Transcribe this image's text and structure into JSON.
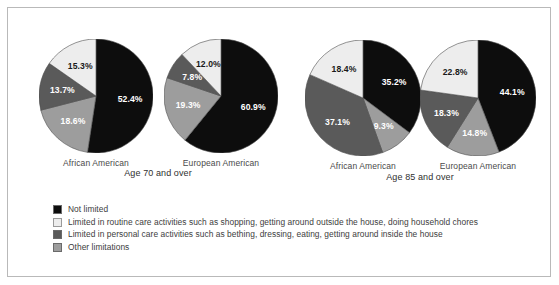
{
  "chart_data": {
    "type": "pie",
    "title": "",
    "subtitle": "",
    "legend_position": "bottom-left",
    "grid": false,
    "categories": [
      "Not limited",
      "Limited in routine care activities such as shopping, getting around outside the house, doing household chores",
      "Limited in personal care activities such as bething, dressing, eating, getting around inside the house",
      "Other limitations"
    ],
    "category_colors": [
      "#0d0d0d",
      "#ededed",
      "#5a5a5a",
      "#9d9d9d"
    ],
    "panels": [
      {
        "panel_label": "Age 70 and over",
        "pies": [
          {
            "name": "African American",
            "slices": [
              {
                "label": "Not limited",
                "value": 52.4,
                "display": "52.4%",
                "color": "#0d0d0d",
                "text_color": "#ffffff"
              },
              {
                "label": "Other limitations",
                "value": 18.6,
                "display": "18.6%",
                "color": "#9d9d9d",
                "text_color": "#ffffff"
              },
              {
                "label": "Limited in personal care activities such as bething, dressing, eating, getting around inside the house",
                "value": 13.7,
                "display": "13.7%",
                "color": "#5a5a5a",
                "text_color": "#ffffff"
              },
              {
                "label": "Limited in routine care activities such as shopping, getting around outside the house, doing household chores",
                "value": 15.3,
                "display": "15.3%",
                "color": "#ededed",
                "text_color": "#1a1a1a"
              }
            ]
          },
          {
            "name": "European American",
            "slices": [
              {
                "label": "Not limited",
                "value": 60.9,
                "display": "60.9%",
                "color": "#0d0d0d",
                "text_color": "#ffffff"
              },
              {
                "label": "Other limitations",
                "value": 19.3,
                "display": "19.3%",
                "color": "#9d9d9d",
                "text_color": "#ffffff"
              },
              {
                "label": "Limited in personal care activities such as bething, dressing, eating, getting around inside the house",
                "value": 7.8,
                "display": "7.8%",
                "color": "#5a5a5a",
                "text_color": "#ffffff"
              },
              {
                "label": "Limited in routine care activities such as shopping, getting around outside the house, doing household chores",
                "value": 12.0,
                "display": "12.0%",
                "color": "#ededed",
                "text_color": "#1a1a1a"
              }
            ]
          }
        ]
      },
      {
        "panel_label": "Age 85 and over",
        "pies": [
          {
            "name": "African American",
            "slices": [
              {
                "label": "Not limited",
                "value": 35.2,
                "display": "35.2%",
                "color": "#0d0d0d",
                "text_color": "#ffffff"
              },
              {
                "label": "Other limitations",
                "value": 9.3,
                "display": "9.3%",
                "color": "#9d9d9d",
                "text_color": "#ffffff"
              },
              {
                "label": "Limited in personal care activities such as bething, dressing, eating, getting around inside the house",
                "value": 37.1,
                "display": "37.1%",
                "color": "#5a5a5a",
                "text_color": "#ffffff"
              },
              {
                "label": "Limited in routine care activities such as shopping, getting around outside the house, doing household chores",
                "value": 18.4,
                "display": "18.4%",
                "color": "#ededed",
                "text_color": "#1a1a1a"
              }
            ]
          },
          {
            "name": "European American",
            "slices": [
              {
                "label": "Not limited",
                "value": 44.1,
                "display": "44.1%",
                "color": "#0d0d0d",
                "text_color": "#ffffff"
              },
              {
                "label": "Other limitations",
                "value": 14.8,
                "display": "14.8%",
                "color": "#9d9d9d",
                "text_color": "#ffffff"
              },
              {
                "label": "Limited in personal care activities such as bething, dressing, eating, getting around inside the house",
                "value": 18.3,
                "display": "18.3%",
                "color": "#5a5a5a",
                "text_color": "#ffffff"
              },
              {
                "label": "Limited in routine care activities such as shopping, getting around outside the house, doing household chores",
                "value": 22.8,
                "display": "22.8%",
                "color": "#ededed",
                "text_color": "#1a1a1a"
              }
            ]
          }
        ]
      }
    ]
  },
  "legend": {
    "items": [
      {
        "color": "#0d0d0d",
        "label": "Not limited"
      },
      {
        "color": "#ededed",
        "label": "Limited in routine care activities such as shopping, getting around outside the house, doing household chores"
      },
      {
        "color": "#5a5a5a",
        "label": "Limited in personal care activities such as bething, dressing, eating, getting around inside the house"
      },
      {
        "color": "#9d9d9d",
        "label": "Other limitations"
      }
    ]
  }
}
